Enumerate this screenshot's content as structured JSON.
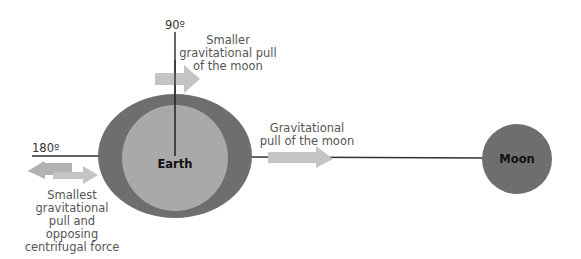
{
  "diagram": {
    "bodies": {
      "earth": {
        "label": "Earth"
      },
      "moon": {
        "label": "Moon"
      }
    },
    "angles": {
      "top": "90º",
      "left": "180º"
    },
    "labels": {
      "top": [
        "Smaller",
        "gravitational pull",
        "of the moon"
      ],
      "right": [
        "Gravitational",
        "pull of the moon"
      ],
      "left": [
        "Smallest",
        "gravitational",
        "pull and",
        "opposing",
        "centrifugal force"
      ]
    },
    "colors": {
      "earth_outer": "#6e6e6e",
      "earth_inner": "#a9a9a9",
      "moon": "#6e6e6e",
      "arrow": "#c4c4c4",
      "arrow_left": "#b2b2b2",
      "line": "#333333"
    }
  }
}
